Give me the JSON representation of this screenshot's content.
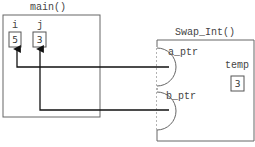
{
  "main_frame": {
    "title": "main()",
    "variables": [
      {
        "name": "i",
        "value": "5"
      },
      {
        "name": "j",
        "value": "3"
      }
    ]
  },
  "swap_frame": {
    "title": "Swap_Int()",
    "params": [
      {
        "name": "a_ptr",
        "points_to": "i"
      },
      {
        "name": "b_ptr",
        "points_to": "j"
      }
    ],
    "locals": [
      {
        "name": "temp",
        "value": "3"
      }
    ]
  },
  "colors": {
    "stroke": "#555555",
    "arrow": "#111111",
    "text": "#444444"
  }
}
